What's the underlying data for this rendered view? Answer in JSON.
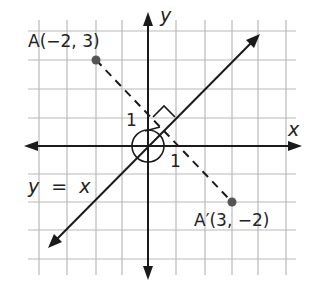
{
  "figure": {
    "type": "coordinate-plane reflection diagram",
    "axes": {
      "x_label": "x",
      "y_label": "y"
    },
    "line": {
      "equation": "y = x",
      "label": "y  =  x"
    },
    "points": [
      {
        "name": "A",
        "label": "A(−2, 3)",
        "x": -2,
        "y": 3
      },
      {
        "name": "A'",
        "label": "A′(3, −2)",
        "x": 3,
        "y": -2
      }
    ],
    "segment": {
      "from": "A",
      "to": "A'",
      "style": "dashed"
    },
    "annotations": {
      "angle_label_1a": "1",
      "angle_label_1b": "1",
      "right_angle_marker": "perpendicular at intersection with y = x",
      "origin_circle": "circle around origin"
    },
    "grid": {
      "x_range": [
        -4,
        5
      ],
      "y_range": [
        -4,
        4
      ]
    },
    "colors": {
      "grid": "#b9b9b9",
      "ink": "#1a1a1a",
      "point": "#555555"
    }
  }
}
